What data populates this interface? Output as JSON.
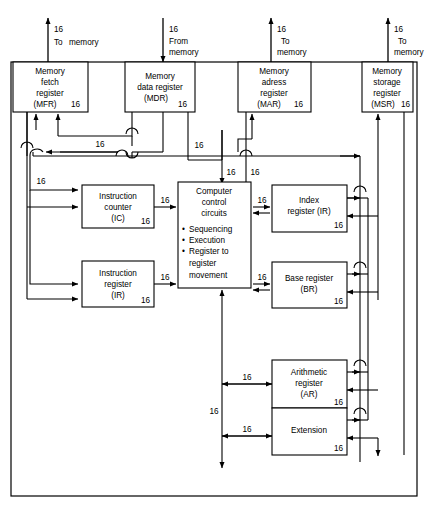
{
  "diagram": {
    "bus_width_label": "16",
    "frame": {
      "present": true
    },
    "external_ports": [
      {
        "id": "mfr-port",
        "bits": "16",
        "label_line1": "To",
        "label_line2": "memory",
        "direction": "out",
        "x": 48
      },
      {
        "id": "mdr-port",
        "bits": "16",
        "label_line1": "From",
        "label_line2": "memory",
        "direction": "in",
        "x": 163
      },
      {
        "id": "mar-port",
        "bits": "16",
        "label_line1": "To",
        "label_line2": "memory",
        "direction": "out",
        "x": 271
      },
      {
        "id": "msr-port",
        "bits": "16",
        "label_line1": "To",
        "label_line2": "memory",
        "direction": "out",
        "x": 388
      }
    ],
    "blocks": [
      {
        "id": "mfr",
        "name": "memory-fetch-register",
        "lines": [
          "Memory",
          "fetch",
          "register",
          "(MFR)"
        ],
        "bits": "16"
      },
      {
        "id": "mdr",
        "name": "memory-data-register",
        "lines": [
          "Memory",
          "data register",
          "(MDR)"
        ],
        "bits": "16"
      },
      {
        "id": "mar",
        "name": "memory-address-register",
        "lines": [
          "Memory",
          "adress",
          "register",
          "(MAR)"
        ],
        "bits": "16"
      },
      {
        "id": "msr",
        "name": "memory-storage-register",
        "lines": [
          "Memory",
          "storage",
          "register",
          "(MSR)"
        ],
        "bits": "16"
      },
      {
        "id": "ic",
        "name": "instruction-counter",
        "lines": [
          "Instruction",
          "counter",
          "(IC)"
        ],
        "bits": "16"
      },
      {
        "id": "ir",
        "name": "instruction-register",
        "lines": [
          "Instruction",
          "register",
          "(IR)"
        ],
        "bits": "16"
      },
      {
        "id": "ccc",
        "name": "computer-control-circuits",
        "lines": [
          "Computer",
          "control",
          "circuits"
        ],
        "bullets": [
          "Sequencing",
          "Execution",
          "Register to",
          "register",
          "movement"
        ]
      },
      {
        "id": "indexr",
        "name": "index-register",
        "lines": [
          "Index",
          "register (IR)"
        ],
        "bits": "16"
      },
      {
        "id": "baser",
        "name": "base-register",
        "lines": [
          "Base register",
          "(BR)"
        ],
        "bits": "16"
      },
      {
        "id": "ar",
        "name": "arithmetic-register",
        "lines": [
          "Arithmetic",
          "register",
          "(AR)"
        ],
        "bits": "16"
      },
      {
        "id": "ext",
        "name": "extension-register",
        "lines": [
          "Extension"
        ],
        "bits": "16"
      }
    ],
    "bus_labels": [
      {
        "id": "b-mdr-left",
        "text": "16",
        "x": 100,
        "y": 127
      },
      {
        "id": "b-mdr-right",
        "text": "16",
        "x": 198,
        "y": 139
      },
      {
        "id": "b-left-down",
        "text": "16",
        "x": 41,
        "y": 184
      },
      {
        "id": "b-ccc-top",
        "text": "16",
        "x": 228,
        "y": 172
      },
      {
        "id": "b-mar-left",
        "text": "16",
        "x": 247,
        "y": 177
      },
      {
        "id": "b-ic-out",
        "text": "16",
        "x": 164,
        "y": 199
      },
      {
        "id": "b-ir-out",
        "text": "16",
        "x": 164,
        "y": 275
      },
      {
        "id": "b-idx-in",
        "text": "16",
        "x": 261,
        "y": 199
      },
      {
        "id": "b-base-in",
        "text": "16",
        "x": 261,
        "y": 275
      },
      {
        "id": "b-ar-in",
        "text": "16",
        "x": 247,
        "y": 378
      },
      {
        "id": "b-ext-in",
        "text": "16",
        "x": 247,
        "y": 430
      },
      {
        "id": "b-vert-low",
        "text": "16",
        "x": 215,
        "y": 412
      }
    ]
  }
}
